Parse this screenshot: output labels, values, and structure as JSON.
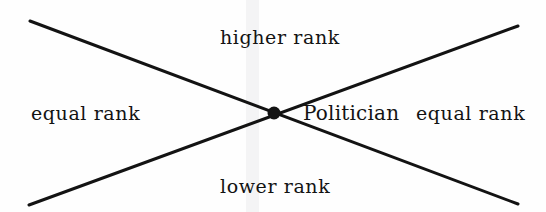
{
  "figure": {
    "type": "rank-relation-diagram",
    "background_color": "#fefefe",
    "line_color": "#131313",
    "text_color": "#131313",
    "center_point": {
      "label": "Politician",
      "x": 274,
      "y": 113,
      "dot_diameter": 13,
      "dot_color": "#131313"
    },
    "lines": [
      {
        "name": "descending-diagonal",
        "x1": 30,
        "y1": 21,
        "x2": 518,
        "y2": 204,
        "stroke_width": 3
      },
      {
        "name": "ascending-diagonal",
        "x1": 29,
        "y1": 205,
        "x2": 518,
        "y2": 26,
        "stroke_width": 3
      }
    ],
    "sectors": [
      {
        "id": "top",
        "label": "higher rank"
      },
      {
        "id": "bottom",
        "label": "lower rank"
      },
      {
        "id": "left",
        "label": "equal rank"
      },
      {
        "id": "right",
        "label": "equal rank"
      }
    ]
  }
}
